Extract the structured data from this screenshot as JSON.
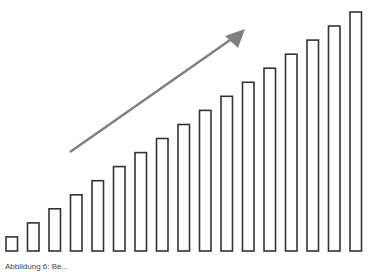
{
  "chart_data": {
    "type": "bar",
    "title": "",
    "xlabel": "",
    "ylabel": "",
    "categories": [
      "1",
      "2",
      "3",
      "4",
      "5",
      "6",
      "7",
      "8",
      "9",
      "10",
      "11",
      "12",
      "13",
      "14",
      "15",
      "16",
      "17"
    ],
    "values": [
      1,
      2,
      3,
      4,
      5,
      6,
      7,
      8,
      9,
      10,
      11,
      12,
      13,
      14,
      15,
      16,
      17
    ],
    "ylim": [
      0,
      17
    ],
    "grid": false,
    "legend": null,
    "bar_style": {
      "fill": "#ffffff",
      "stroke": "#333333"
    },
    "annotations": [
      {
        "type": "arrow",
        "description": "upward trend arrow",
        "color": "#808080",
        "from": [
          70,
          152
        ],
        "to": [
          245,
          29
        ]
      }
    ]
  },
  "caption": "Abbildung 6: Be..."
}
